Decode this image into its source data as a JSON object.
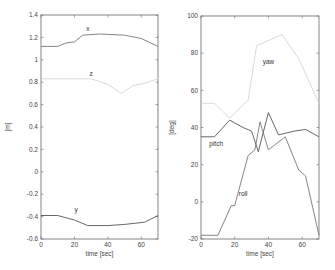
{
  "chart_data": [
    {
      "type": "line",
      "title": "",
      "xlabel": "time [sec]",
      "ylabel": "[m]",
      "xlim": [
        0,
        70
      ],
      "ylim": [
        -0.6,
        1.4
      ],
      "xticks": [
        0,
        20,
        40,
        60
      ],
      "xtick_labels": [
        "0",
        "20",
        "40",
        "60"
      ],
      "yticks": [
        -0.6,
        -0.4,
        -0.2,
        0,
        0.2,
        0.4,
        0.6,
        0.8,
        1,
        1.2,
        1.4
      ],
      "ytick_labels": [
        "-0.6",
        "-0.4",
        "-0.2",
        "0",
        "0.2",
        "0.4",
        "0.6",
        "0.8",
        "1",
        "1.2",
        "1.4"
      ],
      "grid": false,
      "legend": "inline labels",
      "series": [
        {
          "name": "x",
          "color": "#777777",
          "label_at": [
            28,
            1.255
          ],
          "x": [
            0,
            10,
            15,
            20,
            25,
            35,
            50,
            60,
            70
          ],
          "values": [
            1.12,
            1.12,
            1.15,
            1.16,
            1.22,
            1.23,
            1.22,
            1.19,
            1.12
          ]
        },
        {
          "name": "z",
          "color": "#d4d4d4",
          "label_at": [
            30,
            0.855
          ],
          "x": [
            0,
            30,
            40,
            48,
            55,
            62,
            70
          ],
          "values": [
            0.83,
            0.83,
            0.78,
            0.7,
            0.77,
            0.79,
            0.83
          ]
        },
        {
          "name": "y",
          "color": "#555555",
          "label_at": [
            21,
            -0.36
          ],
          "x": [
            0,
            10,
            20,
            28,
            40,
            50,
            62,
            70
          ],
          "values": [
            -0.39,
            -0.39,
            -0.43,
            -0.48,
            -0.48,
            -0.47,
            -0.45,
            -0.39
          ]
        }
      ]
    },
    {
      "type": "line",
      "title": "",
      "xlabel": "time [sec]",
      "ylabel": "[deg]",
      "xlim": [
        0,
        70
      ],
      "ylim": [
        -20,
        100
      ],
      "xticks": [
        0,
        20,
        40,
        60
      ],
      "xtick_labels": [
        "0",
        "20",
        "40",
        "60"
      ],
      "yticks": [
        -20,
        0,
        20,
        40,
        60,
        80,
        100
      ],
      "ytick_labels": [
        "-20",
        "0",
        "20",
        "40",
        "60",
        "80",
        "100"
      ],
      "grid": false,
      "legend": "inline labels",
      "series": [
        {
          "name": "yaw",
          "color": "#d4d4d4",
          "label_at": [
            40,
            74
          ],
          "x": [
            0,
            8,
            17,
            28,
            33,
            38,
            48,
            58,
            70
          ],
          "values": [
            53,
            53,
            45,
            55,
            84,
            86,
            90,
            77,
            53
          ]
        },
        {
          "name": "pitch",
          "color": "#555555",
          "label_at": [
            9,
            30
          ],
          "x": [
            0,
            8,
            17,
            25,
            30,
            34,
            40,
            46,
            55,
            62,
            70
          ],
          "values": [
            35,
            35,
            44,
            40,
            38,
            27,
            48,
            36,
            38,
            39,
            35
          ]
        },
        {
          "name": "roll",
          "color": "#777777",
          "label_at": [
            25,
            3
          ],
          "x": [
            0,
            10,
            18,
            20,
            28,
            32,
            35,
            40,
            50,
            58,
            62,
            70
          ],
          "values": [
            -18,
            -18,
            -2,
            -2,
            25,
            28,
            43,
            28,
            35,
            17,
            14,
            -18
          ]
        }
      ]
    }
  ]
}
